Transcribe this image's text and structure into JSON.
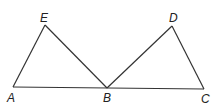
{
  "diagram": {
    "stroke_color": "#333333",
    "points": {
      "A": {
        "label": "A",
        "x": 13,
        "y": 87
      },
      "E": {
        "label": "E",
        "x": 45,
        "y": 25
      },
      "B": {
        "label": "B",
        "x": 107,
        "y": 88
      },
      "D": {
        "label": "D",
        "x": 172,
        "y": 26
      },
      "C": {
        "label": "C",
        "x": 204,
        "y": 89
      }
    },
    "segments": [
      "AE",
      "EB",
      "AC",
      "BD",
      "DC"
    ]
  }
}
